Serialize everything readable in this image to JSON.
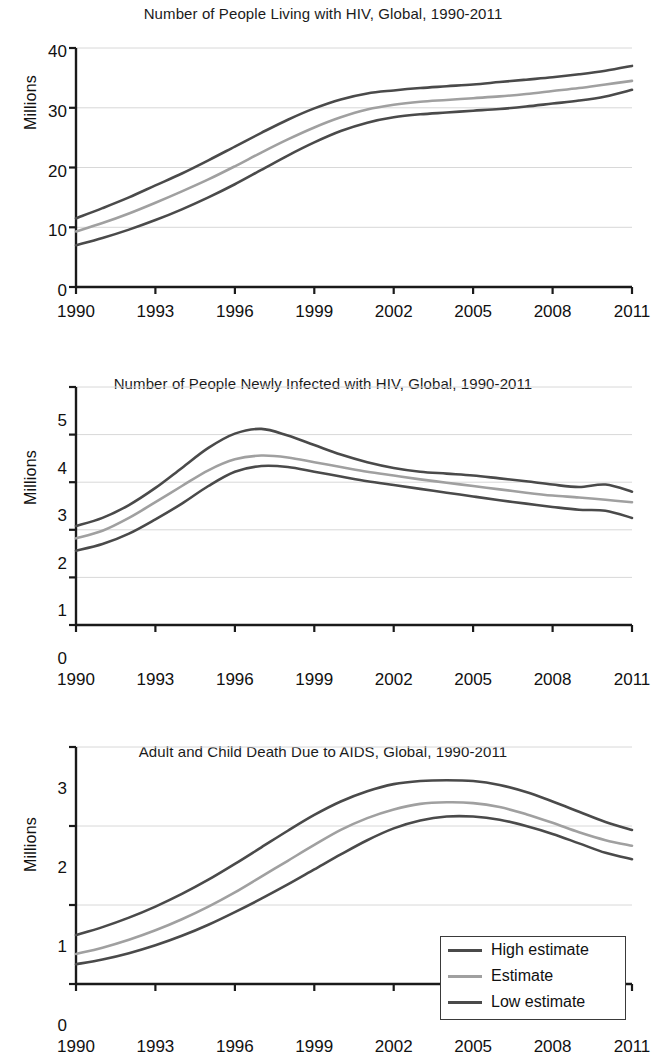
{
  "figure": {
    "ylabel": "Millions",
    "legend": {
      "position": "bottom-right-of-third-panel",
      "entries": [
        {
          "label": "High estimate",
          "color": "#4a4a4a"
        },
        {
          "label": "Estimate",
          "color": "#a0a0a0"
        },
        {
          "label": "Low estimate",
          "color": "#4a4a4a"
        }
      ]
    },
    "colors": {
      "high": "#4a4a4a",
      "estimate": "#a0a0a0",
      "low": "#4a4a4a",
      "axis": "#1a1a1a",
      "grid": "#d8d8d8",
      "background": "#ffffff"
    }
  },
  "chart_data": [
    {
      "type": "line",
      "title": "Number of People Living with HIV, Global, 1990-2011",
      "xlabel": "",
      "ylabel": "Millions",
      "xlim": [
        1990,
        2011
      ],
      "ylim": [
        0,
        40
      ],
      "yticks": [
        0,
        10,
        20,
        30,
        40
      ],
      "xticks": [
        1990,
        1993,
        1996,
        1999,
        2002,
        2005,
        2008,
        2011
      ],
      "grid": true,
      "x": [
        1990,
        1991,
        1992,
        1993,
        1994,
        1995,
        1996,
        1997,
        1998,
        1999,
        2000,
        2001,
        2002,
        2003,
        2004,
        2005,
        2006,
        2007,
        2008,
        2009,
        2010,
        2011
      ],
      "series": [
        {
          "name": "High estimate",
          "color": "#4a4a4a",
          "values": [
            11.5,
            13.2,
            15.0,
            17.0,
            19.0,
            21.2,
            23.5,
            25.8,
            28.0,
            29.9,
            31.4,
            32.4,
            32.9,
            33.3,
            33.6,
            33.9,
            34.3,
            34.7,
            35.1,
            35.6,
            36.2,
            37.0
          ]
        },
        {
          "name": "Estimate",
          "color": "#a0a0a0",
          "values": [
            9.3,
            10.7,
            12.3,
            14.1,
            16.0,
            18.0,
            20.2,
            22.5,
            24.7,
            26.7,
            28.4,
            29.7,
            30.5,
            31.0,
            31.3,
            31.6,
            31.9,
            32.3,
            32.8,
            33.3,
            33.9,
            34.5
          ]
        },
        {
          "name": "Low estimate",
          "color": "#4a4a4a",
          "values": [
            7.0,
            8.2,
            9.6,
            11.2,
            13.0,
            15.0,
            17.2,
            19.6,
            22.0,
            24.2,
            26.1,
            27.5,
            28.4,
            28.9,
            29.2,
            29.5,
            29.8,
            30.2,
            30.7,
            31.2,
            31.9,
            33.0
          ]
        }
      ]
    },
    {
      "type": "line",
      "title": "Number of People Newly Infected with HIV, Global, 1990-2011",
      "xlabel": "",
      "ylabel": "Millions",
      "xlim": [
        1990,
        2011
      ],
      "ylim": [
        0,
        5
      ],
      "yticks": [
        0,
        1,
        2,
        3,
        4,
        5
      ],
      "xticks": [
        1990,
        1993,
        1996,
        1999,
        2002,
        2005,
        2008,
        2011
      ],
      "grid": true,
      "x": [
        1990,
        1991,
        1992,
        1993,
        1994,
        1995,
        1996,
        1997,
        1998,
        1999,
        2000,
        2001,
        2002,
        2003,
        2004,
        2005,
        2006,
        2007,
        2008,
        2009,
        2010,
        2011
      ],
      "series": [
        {
          "name": "High estimate",
          "color": "#4a4a4a",
          "values": [
            2.08,
            2.25,
            2.52,
            2.88,
            3.3,
            3.72,
            4.02,
            4.12,
            3.98,
            3.78,
            3.58,
            3.42,
            3.3,
            3.22,
            3.18,
            3.14,
            3.08,
            3.02,
            2.95,
            2.9,
            2.95,
            2.8
          ]
        },
        {
          "name": "Estimate",
          "color": "#a0a0a0",
          "values": [
            1.82,
            1.98,
            2.25,
            2.58,
            2.92,
            3.25,
            3.48,
            3.56,
            3.52,
            3.42,
            3.32,
            3.22,
            3.14,
            3.06,
            2.99,
            2.92,
            2.85,
            2.78,
            2.72,
            2.68,
            2.63,
            2.58
          ]
        },
        {
          "name": "Low estimate",
          "color": "#4a4a4a",
          "values": [
            1.56,
            1.7,
            1.92,
            2.22,
            2.55,
            2.92,
            3.22,
            3.34,
            3.32,
            3.22,
            3.12,
            3.02,
            2.94,
            2.86,
            2.78,
            2.7,
            2.62,
            2.55,
            2.48,
            2.42,
            2.4,
            2.25
          ]
        }
      ]
    },
    {
      "type": "line",
      "title": "Adult and Child Death Due to AIDS, Global, 1990-2011",
      "xlabel": "",
      "ylabel": "Millions",
      "xlim": [
        1990,
        2011
      ],
      "ylim": [
        0,
        3
      ],
      "yticks": [
        0,
        1,
        2,
        3
      ],
      "xticks": [
        1990,
        1993,
        1996,
        1999,
        2002,
        2005,
        2008,
        2011
      ],
      "grid": true,
      "x": [
        1990,
        1991,
        1992,
        1993,
        1994,
        1995,
        1996,
        1997,
        1998,
        1999,
        2000,
        2001,
        2002,
        2003,
        2004,
        2005,
        2006,
        2007,
        2008,
        2009,
        2010,
        2011
      ],
      "series": [
        {
          "name": "High estimate",
          "color": "#4a4a4a",
          "values": [
            0.62,
            0.72,
            0.84,
            0.98,
            1.14,
            1.32,
            1.52,
            1.73,
            1.94,
            2.14,
            2.31,
            2.44,
            2.53,
            2.57,
            2.58,
            2.57,
            2.52,
            2.43,
            2.31,
            2.18,
            2.05,
            1.95
          ]
        },
        {
          "name": "Estimate",
          "color": "#a0a0a0",
          "values": [
            0.38,
            0.46,
            0.56,
            0.68,
            0.82,
            0.98,
            1.16,
            1.36,
            1.56,
            1.76,
            1.95,
            2.1,
            2.21,
            2.28,
            2.3,
            2.29,
            2.24,
            2.15,
            2.04,
            1.92,
            1.82,
            1.75
          ]
        },
        {
          "name": "Low estimate",
          "color": "#4a4a4a",
          "values": [
            0.25,
            0.31,
            0.39,
            0.49,
            0.61,
            0.75,
            0.91,
            1.08,
            1.26,
            1.45,
            1.64,
            1.82,
            1.97,
            2.07,
            2.12,
            2.12,
            2.08,
            2.0,
            1.9,
            1.78,
            1.66,
            1.58
          ]
        }
      ]
    }
  ]
}
